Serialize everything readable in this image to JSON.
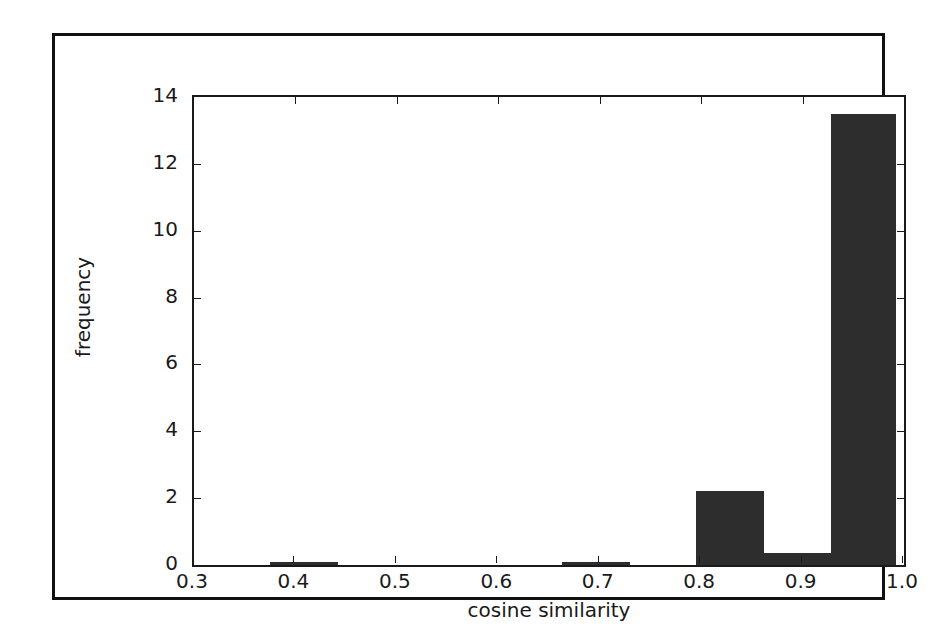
{
  "chart_data": {
    "type": "bar",
    "title": "",
    "subtitle": "",
    "xlabel": "cosine similarity",
    "ylabel": "frequency",
    "xlim": [
      0.3,
      1.0
    ],
    "ylim": [
      0,
      14
    ],
    "grid": false,
    "legend": null,
    "bar_color": "#2d2d2d",
    "axis_color": "#1a1a1a",
    "background_color": "#ffffff",
    "frame_color": "#111111",
    "xticks": [
      "0.3",
      "0.4",
      "0.5",
      "0.6",
      "0.7",
      "0.8",
      "0.9",
      "1.0"
    ],
    "xtick_values": [
      0.3,
      0.4,
      0.5,
      0.6,
      0.7,
      0.8,
      0.9,
      1.0
    ],
    "yticks": [
      "0",
      "2",
      "4",
      "6",
      "8",
      "10",
      "12",
      "14"
    ],
    "ytick_values": [
      0,
      2,
      4,
      6,
      8,
      10,
      12,
      14
    ],
    "bin_edges": [
      0.3,
      0.365,
      0.43,
      0.495,
      0.56,
      0.625,
      0.69,
      0.755,
      0.82,
      0.885,
      0.95,
      1.0
    ],
    "bars": [
      {
        "x0": 0.375,
        "x1": 0.442,
        "height": 0.1
      },
      {
        "x0": 0.663,
        "x1": 0.73,
        "height": 0.08
      },
      {
        "x0": 0.795,
        "x1": 0.862,
        "height": 2.2
      },
      {
        "x0": 0.862,
        "x1": 0.928,
        "height": 0.35
      },
      {
        "x0": 0.928,
        "x1": 0.992,
        "height": 13.5
      }
    ],
    "categories": [
      "0.375-0.442",
      "0.663-0.730",
      "0.795-0.862",
      "0.862-0.928",
      "0.928-0.992"
    ],
    "values": [
      0.1,
      0.08,
      2.2,
      0.35,
      13.5
    ]
  }
}
